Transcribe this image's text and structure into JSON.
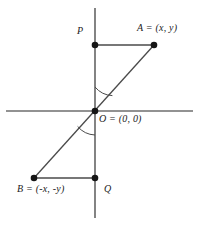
{
  "figure": {
    "background_color": "#ffffff",
    "ink_color": "#4a4a4a",
    "text_color": "#1b1b1b",
    "point_color": "#1a1a1a",
    "width": 200,
    "height": 227,
    "axes": {
      "x_axis": {
        "name": "horizontal-axis",
        "x1": 6,
        "y1": 111,
        "x2": 193,
        "y2": 111
      },
      "y_axis": {
        "name": "vertical-axis",
        "x1": 95,
        "y1": 8,
        "x2": 95,
        "y2": 218
      }
    },
    "origin": {
      "x": 95,
      "y": 111
    },
    "points": [
      {
        "id": "P",
        "label": "P",
        "x": 95,
        "y": 45,
        "label_x": 77,
        "label_y": 26
      },
      {
        "id": "A",
        "label": "A = (x, y)",
        "x": 154,
        "y": 45,
        "label_x": 137,
        "label_y": 23
      },
      {
        "id": "O",
        "label": "O = (0, 0)",
        "x": 95,
        "y": 111,
        "label_x": 99,
        "label_y": 114
      },
      {
        "id": "Q",
        "label": "Q",
        "x": 95,
        "y": 178,
        "label_x": 103,
        "label_y": 184
      },
      {
        "id": "B",
        "label": "B = (-x, -y)",
        "x": 34,
        "y": 178,
        "label_x": 17,
        "label_y": 183
      }
    ],
    "segments": [
      {
        "name": "segment-P-A",
        "x1": 95,
        "y1": 45,
        "x2": 154,
        "y2": 45
      },
      {
        "name": "segment-B-Q",
        "x1": 34,
        "y1": 178,
        "x2": 95,
        "y2": 178
      },
      {
        "name": "segment-A-B",
        "x1": 154,
        "y1": 45,
        "x2": 34,
        "y2": 178
      }
    ],
    "angle_arcs": [
      {
        "name": "angle-arc-upper",
        "path": "M 95 87 A 24 24 0 0 0 112 95"
      },
      {
        "name": "angle-arc-lower",
        "path": "M 95 135 A 24 24 0 0 1 78 127"
      }
    ],
    "point_radius": 3.2,
    "axis_stroke_width": 1.6,
    "segment_stroke_width": 1.3,
    "arc_stroke_width": 1.0
  }
}
